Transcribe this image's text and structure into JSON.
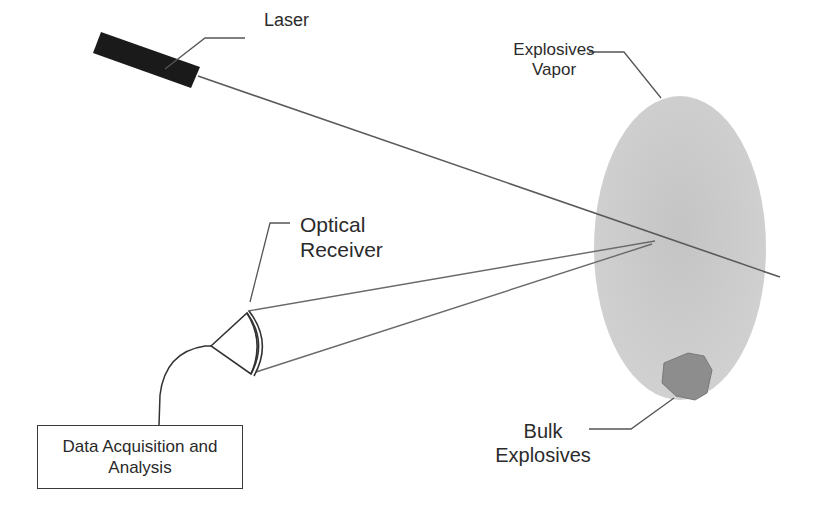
{
  "diagram": {
    "type": "schematic",
    "labels": {
      "laser": "Laser",
      "explosives_vapor_line1": "Explosives",
      "explosives_vapor_line2": "Vapor",
      "optical_receiver_line1": "Optical",
      "optical_receiver_line2": "Receiver",
      "bulk_explosives_line1": "Bulk",
      "bulk_explosives_line2": "Explosives",
      "data_box_line1": "Data Acquisition and",
      "data_box_line2": "Analysis"
    },
    "colors": {
      "laser_body": "#1c1c1c",
      "vapor_cloud": "#c8c8c8",
      "bulk_explosive": "#8f8f8f",
      "lines": "#555555",
      "background": "#ffffff"
    }
  }
}
